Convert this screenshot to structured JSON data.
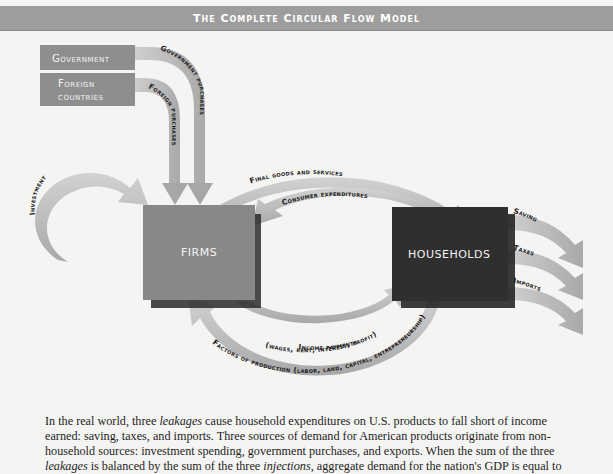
{
  "title": "The Complete Circular Flow Model",
  "colors": {
    "title_bar": "#9d9d9d",
    "source_box": "#8e8e8e",
    "firms_box": "#888888",
    "households_box": "#2f2f2f",
    "arrow": "#bdbdbd",
    "arrow_dark": "#a5a5a5",
    "background": "#f4f4f2"
  },
  "nodes": {
    "government": "Government",
    "foreign_line1": "Foreign",
    "foreign_line2": "countries",
    "firms": "FIRMS",
    "households": "HOUSEHOLDS"
  },
  "flows": {
    "government_purchases": "Government purchases",
    "foreign_purchases": "Foreign purchases",
    "investment": "Investment",
    "final_goods": "Final goods and services",
    "consumer_expenditures": "Consumer expenditures",
    "income_payments": "Income payments",
    "income_detail": "(wages, rent, interest, profit)",
    "factors": "Factors of production (labor, land, capital, entrepreneurship)",
    "saving": "Saving",
    "taxes": "Taxes",
    "imports": "Imports"
  },
  "caption": {
    "p1": "In the real world, three ",
    "leakages": "leakages",
    "p2": " cause household expenditures on U.S. products to fall short of income earned: saving, taxes, and imports. Three sources of demand for American products originate from non-household sources: investment spending, government purchases, and exports. When the sum of the three ",
    "leakages2": "leakages",
    "p3": " is balanced by the sum of the three ",
    "injections": "injections",
    "p4": ", aggregate demand for the nation's GDP is equal to"
  }
}
